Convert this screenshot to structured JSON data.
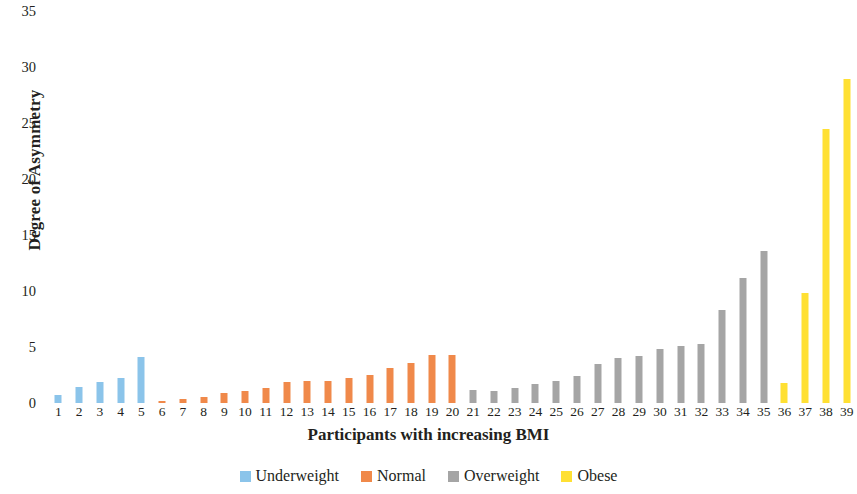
{
  "chart_data": {
    "type": "bar",
    "title": "",
    "xlabel": "Participants with increasing BMI",
    "ylabel": "Degree of Asymmetry",
    "ylim": [
      0,
      35
    ],
    "yticks": [
      0,
      5,
      10,
      15,
      20,
      25,
      30,
      35
    ],
    "grid": false,
    "legend_position": "bottom",
    "categories": [
      "1",
      "2",
      "3",
      "4",
      "5",
      "6",
      "7",
      "8",
      "9",
      "10",
      "11",
      "12",
      "13",
      "14",
      "15",
      "16",
      "17",
      "18",
      "19",
      "20",
      "21",
      "22",
      "23",
      "24",
      "25",
      "26",
      "27",
      "28",
      "29",
      "30",
      "31",
      "32",
      "33",
      "34",
      "35",
      "36",
      "37",
      "38",
      "39"
    ],
    "values": [
      0.7,
      1.4,
      1.9,
      2.2,
      4.1,
      0.15,
      0.4,
      0.5,
      0.9,
      1.1,
      1.3,
      1.9,
      2.0,
      2.0,
      2.2,
      2.5,
      3.1,
      3.6,
      4.3,
      4.3,
      1.2,
      1.1,
      1.3,
      1.7,
      2.0,
      2.4,
      3.5,
      4.0,
      4.2,
      4.8,
      5.1,
      5.3,
      8.3,
      11.2,
      13.6,
      1.8,
      9.8,
      24.5,
      28.9
    ],
    "groups": [
      "Underweight",
      "Underweight",
      "Underweight",
      "Underweight",
      "Underweight",
      "Normal",
      "Normal",
      "Normal",
      "Normal",
      "Normal",
      "Normal",
      "Normal",
      "Normal",
      "Normal",
      "Normal",
      "Normal",
      "Normal",
      "Normal",
      "Normal",
      "Normal",
      "Overweight",
      "Overweight",
      "Overweight",
      "Overweight",
      "Overweight",
      "Overweight",
      "Overweight",
      "Overweight",
      "Overweight",
      "Overweight",
      "Overweight",
      "Overweight",
      "Overweight",
      "Overweight",
      "Overweight",
      "Obese",
      "Obese",
      "Obese",
      "Obese"
    ],
    "legend": [
      {
        "label": "Underweight",
        "color": "#8BC4EA"
      },
      {
        "label": "Normal",
        "color": "#F0894A"
      },
      {
        "label": "Overweight",
        "color": "#A5A5A5"
      },
      {
        "label": "Obese",
        "color": "#FFE033"
      }
    ],
    "colors": {
      "Underweight": "#8BC4EA",
      "Normal": "#F0894A",
      "Overweight": "#A5A5A5",
      "Obese": "#FFE033"
    }
  }
}
